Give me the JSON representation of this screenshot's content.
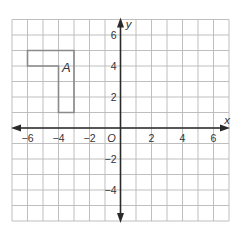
{
  "diagram": {
    "type": "coordinate-grid",
    "x_range": [
      -7,
      7
    ],
    "y_range": [
      -6,
      7
    ],
    "x_axis_label": "x",
    "y_axis_label": "y",
    "origin_label": "O",
    "x_tick_labels": [
      {
        "value": -6,
        "label": "−6"
      },
      {
        "value": -4,
        "label": "−4"
      },
      {
        "value": -2,
        "label": "−2"
      },
      {
        "value": 2,
        "label": "2"
      },
      {
        "value": 4,
        "label": "4"
      },
      {
        "value": 6,
        "label": "6"
      }
    ],
    "y_tick_labels": [
      {
        "value": 6,
        "label": "6"
      },
      {
        "value": 4,
        "label": "4"
      },
      {
        "value": 2,
        "label": "2"
      },
      {
        "value": -2,
        "label": "−2"
      },
      {
        "value": -4,
        "label": "−4"
      }
    ],
    "shapes": [
      {
        "label": "A",
        "vertices": [
          [
            -6,
            5
          ],
          [
            -3,
            5
          ],
          [
            -3,
            1
          ],
          [
            -4,
            1
          ],
          [
            -4,
            4
          ],
          [
            -6,
            4
          ]
        ],
        "label_position": [
          -3.5,
          3.6
        ]
      }
    ],
    "colors": {
      "grid": "#b8b8b8",
      "axis": "#2a2a2a",
      "shape": "#8a8a8a",
      "text": "#333333"
    }
  }
}
